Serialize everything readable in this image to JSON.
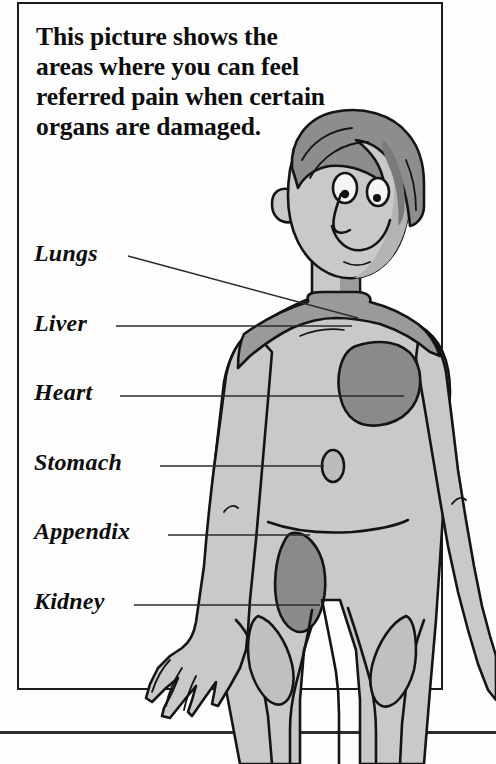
{
  "page": {
    "background_color": "#fdfdfd",
    "frame_color": "#1c1c1c"
  },
  "heading": {
    "text": "This picture shows the areas where you can feel referred pain when certain organs are damaged."
  },
  "labels": [
    {
      "id": "lungs",
      "text": "Lungs"
    },
    {
      "id": "liver",
      "text": "Liver"
    },
    {
      "id": "heart",
      "text": "Heart"
    },
    {
      "id": "stomach",
      "text": "Stomach"
    },
    {
      "id": "appendix",
      "text": "Appendix"
    },
    {
      "id": "kidney",
      "text": "Kidney"
    }
  ],
  "illustration": {
    "description": "Cartoon boy, head and torso, facing viewer, with shaded referred-pain regions",
    "colors": {
      "outline": "#141414",
      "skin": "#c9c9c9",
      "skin_shadow": "#b0b0b0",
      "hair": "#8d8d8d",
      "hair_shadow": "#767676",
      "pain_region_dark": "#8a8a8a",
      "pain_region_mid": "#9a9a9a",
      "eye_white": "#f4f4f4",
      "pupil": "#101010"
    },
    "pain_regions": [
      {
        "name": "lungs-shoulder-band",
        "tone": "mid"
      },
      {
        "name": "liver-shoulder-band",
        "tone": "mid"
      },
      {
        "name": "heart-chest-patch",
        "tone": "dark"
      },
      {
        "name": "stomach-small-oval",
        "tone": "light"
      },
      {
        "name": "appendix-kidney-flank-oval",
        "tone": "dark"
      }
    ]
  }
}
